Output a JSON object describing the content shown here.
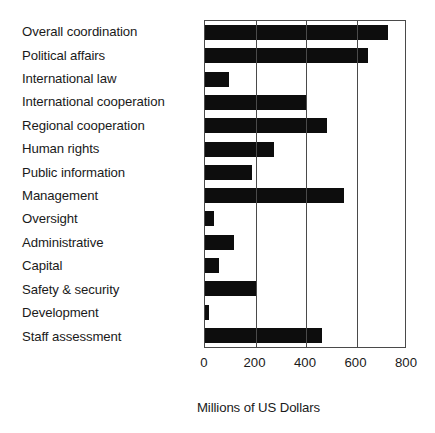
{
  "chart_data": {
    "type": "bar",
    "orientation": "horizontal",
    "title": "",
    "xlabel": "Millions of US Dollars",
    "ylabel": "",
    "xlim": [
      0,
      800
    ],
    "xticks": [
      0,
      200,
      400,
      600,
      800
    ],
    "xtick_labels": [
      "0",
      "200",
      "400",
      "600",
      "800"
    ],
    "grid": true,
    "grid_axis": "x",
    "legend": false,
    "bar_color": "#0d0d0d",
    "axis_color": "#4a4a4a",
    "categories": [
      "Overall coordination",
      "Political affairs",
      "International law",
      "International cooperation",
      "Regional cooperation",
      "Human rights",
      "Public information",
      "Management",
      "Oversight",
      "Administrative",
      "Capital",
      "Safety & security",
      "Development",
      "Staff assessment"
    ],
    "values": [
      725,
      645,
      95,
      400,
      485,
      272,
      186,
      550,
      35,
      115,
      57,
      200,
      15,
      462
    ]
  }
}
